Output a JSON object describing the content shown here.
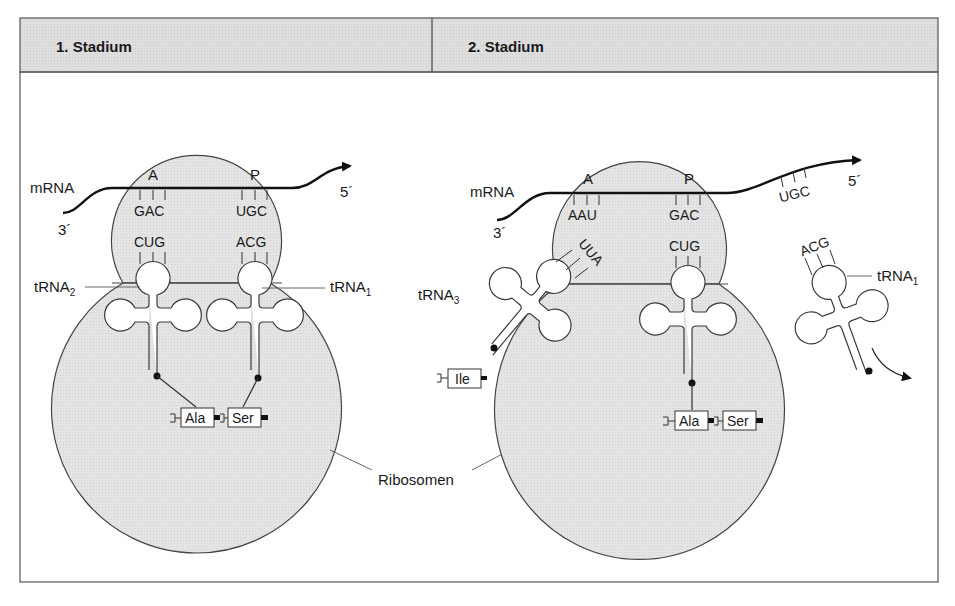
{
  "figure": {
    "header": {
      "stage1_title": "1. Stadium",
      "stage2_title": "2. Stadium"
    },
    "colors": {
      "header_fill": "#dcdcdc",
      "ribosome_fill": "#e2e2e2",
      "line": "#3a3a3a",
      "frame": "#555555",
      "background": "#ffffff"
    },
    "stage1": {
      "mrna_label": "mRNA",
      "end_3": "3´",
      "end_5": "5´",
      "site_a": "A",
      "site_p": "P",
      "codon_a": "GAC",
      "codon_p": "UGC",
      "anticodon_trna2": "CUG",
      "anticodon_trna1": "ACG",
      "trna_left": {
        "base": "tRNA",
        "sub": "2"
      },
      "trna_right": {
        "base": "tRNA",
        "sub": "1"
      },
      "amino_acid_1": "Ala",
      "amino_acid_2": "Ser"
    },
    "stage2": {
      "mrna_label": "mRNA",
      "end_3": "3´",
      "end_5": "5´",
      "site_a": "A",
      "site_p": "P",
      "codon_a": "AAU",
      "codon_p": "GAC",
      "codon_exited": "UGC",
      "anticodon_trna3": "UUA",
      "anticodon_trna2": "CUG",
      "anticodon_trna1": "ACG",
      "trna_incoming": {
        "base": "tRNA",
        "sub": "3"
      },
      "trna_leaving": {
        "base": "tRNA",
        "sub": "1"
      },
      "incoming_amino_acid": "Ile",
      "amino_acid_1": "Ala",
      "amino_acid_2": "Ser"
    },
    "shared_label": "Ribosomen"
  }
}
